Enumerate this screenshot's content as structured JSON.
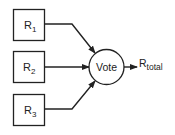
{
  "diagram": {
    "type": "voting-system-block-diagram",
    "inputs": [
      {
        "id": "r1",
        "label": "R",
        "subscript": "1"
      },
      {
        "id": "r2",
        "label": "R",
        "subscript": "2"
      },
      {
        "id": "r3",
        "label": "R",
        "subscript": "3"
      }
    ],
    "voter": {
      "label": "Vote"
    },
    "output": {
      "label": "R",
      "subscript": "total"
    },
    "colors": {
      "stroke": "#222222",
      "background": "#ffffff"
    }
  }
}
